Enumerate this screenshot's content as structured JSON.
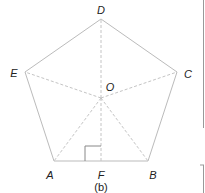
{
  "figure": {
    "caption": "(b)",
    "shape": "regular pentagon",
    "colors": {
      "edge": "#bbbbbb",
      "dashed": "#c4c4c4",
      "label": "#222222",
      "panel_border": "#999999"
    },
    "vertices": {
      "D": {
        "label": "D",
        "x": 101,
        "y": 19
      },
      "C": {
        "label": "C",
        "x": 177,
        "y": 72
      },
      "B": {
        "label": "B",
        "x": 148,
        "y": 161
      },
      "A": {
        "label": "A",
        "x": 54,
        "y": 161
      },
      "E": {
        "label": "E",
        "x": 25,
        "y": 72
      }
    },
    "center": {
      "label": "O",
      "x": 101,
      "y": 98
    },
    "foot": {
      "label": "F",
      "x": 101,
      "y": 161
    },
    "dashed_segments": [
      "OD",
      "OC",
      "OB",
      "OA",
      "OE",
      "OF"
    ],
    "right_angle_marker": "at F, between FA and FO"
  }
}
